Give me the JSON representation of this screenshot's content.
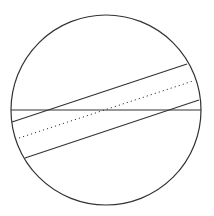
{
  "diagram": {
    "background": "#ffffff",
    "stroke_color": "#333333",
    "circle": {
      "cx": 106,
      "cy": 110,
      "r": 95
    },
    "diameter": {
      "x1": 11,
      "y1": 110,
      "x2": 201,
      "y2": 110
    },
    "strip": {
      "upper_edge": {
        "x1": 12,
        "y1": 122,
        "x2": 187,
        "y2": 64
      },
      "center_line": {
        "x1": 19,
        "y1": 138,
        "x2": 193,
        "y2": 81,
        "style": "dotted"
      },
      "lower_edge": {
        "x1": 25,
        "y1": 158,
        "x2": 199,
        "y2": 100
      }
    }
  }
}
